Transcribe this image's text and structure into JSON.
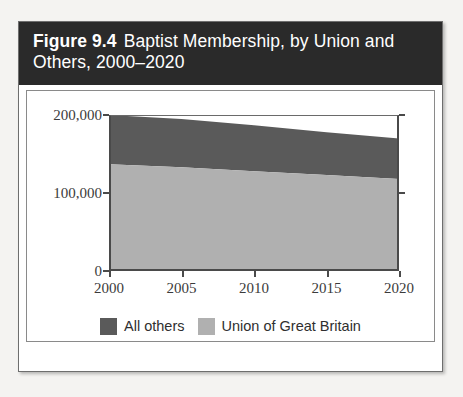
{
  "figure": {
    "number_label": "Figure 9.4",
    "title": "Baptist Membership, by Union and Others, 2000–2020"
  },
  "colors": {
    "all_others": "#5a5a5a",
    "union_of_great_britain": "#b0b0b0",
    "title_bar_background": "#2a2a2a",
    "title_text": "#ffffff",
    "axis": "#4a4a4a",
    "plot_background": "#ffffff"
  },
  "chart_data": {
    "type": "area",
    "stacked": true,
    "title": "Baptist Membership, by Union and Others, 2000–2020",
    "xlabel": "",
    "ylabel": "",
    "x": [
      2000,
      2005,
      2010,
      2015,
      2020
    ],
    "xlim": [
      2000,
      2020
    ],
    "ylim": [
      0,
      200000
    ],
    "xticks": [
      2000,
      2005,
      2010,
      2015,
      2020
    ],
    "xtick_labels": [
      "2000",
      "2005",
      "2010",
      "2015",
      "2020"
    ],
    "yticks": [
      0,
      100000,
      200000
    ],
    "ytick_labels": [
      "0",
      "100,000",
      "200,000"
    ],
    "grid": false,
    "legend_position": "bottom",
    "series": [
      {
        "name": "Union of Great Britain",
        "color": "#b0b0b0",
        "values": [
          137000,
          133000,
          128000,
          123000,
          118000
        ]
      },
      {
        "name": "All others",
        "color": "#5a5a5a",
        "values": [
          63000,
          62000,
          59000,
          55000,
          52000
        ]
      }
    ],
    "totals": [
      200000,
      195000,
      187000,
      178000,
      170000
    ],
    "legend": [
      {
        "label": "All others",
        "color": "#5a5a5a"
      },
      {
        "label": "Union of Great Britain",
        "color": "#b0b0b0"
      }
    ]
  }
}
